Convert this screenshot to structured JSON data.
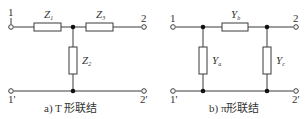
{
  "diagrams": [
    {
      "id": "t-network",
      "caption": "a) T 形联结",
      "terminals": {
        "top_left": "1",
        "top_right": "2",
        "bottom_left": "1'",
        "bottom_right": "2'"
      },
      "components": [
        {
          "symbol": "Z",
          "subscript": "1",
          "position": "series-left"
        },
        {
          "symbol": "Z",
          "subscript": "3",
          "position": "series-right"
        },
        {
          "symbol": "Z",
          "subscript": "2",
          "position": "shunt-middle"
        }
      ]
    },
    {
      "id": "pi-network",
      "caption": "b) π形联结",
      "terminals": {
        "top_left": "1",
        "top_right": "2",
        "bottom_left": "1'",
        "bottom_right": "2'"
      },
      "components": [
        {
          "symbol": "Y",
          "subscript": "b",
          "position": "series-middle"
        },
        {
          "symbol": "Y",
          "subscript": "a",
          "position": "shunt-left"
        },
        {
          "symbol": "Y",
          "subscript": "c",
          "position": "shunt-right"
        }
      ]
    }
  ],
  "colors": {
    "line": "#3a3a3a",
    "node": "#111111",
    "text": "#333333",
    "background": "#ffffff"
  }
}
